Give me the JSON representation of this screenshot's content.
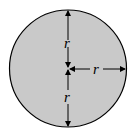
{
  "diagram": {
    "labels": {
      "upper_radius": "r",
      "right_radius": "r",
      "lower_radius": "r"
    },
    "colors": {
      "fill": "#c9c9c9",
      "stroke": "#000000"
    }
  }
}
